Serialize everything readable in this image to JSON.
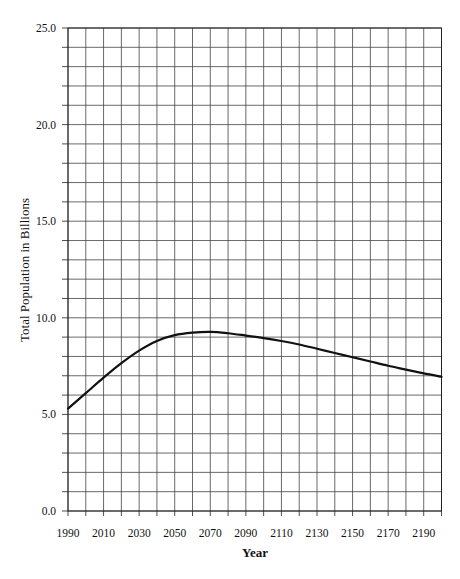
{
  "chart_data": {
    "type": "line",
    "title": "",
    "title_note": "Title cropped at top edge of image; text not legible",
    "xlabel": "Year",
    "ylabel": "Total Population in Billions",
    "xlim": [
      1990,
      2200
    ],
    "ylim": [
      0.0,
      25.0
    ],
    "x_ticks": [
      1990,
      2010,
      2030,
      2050,
      2070,
      2090,
      2110,
      2130,
      2150,
      2170,
      2190
    ],
    "x_tick_labels": [
      "1990",
      "2010",
      "2030",
      "2050",
      "2070",
      "2090",
      "2110",
      "2130",
      "2150",
      "2170",
      "2190"
    ],
    "x_minor_step": 10,
    "y_ticks": [
      0,
      5,
      10,
      15,
      20,
      25
    ],
    "y_tick_labels": [
      "0.0",
      "5.0",
      "10.0",
      "15.0",
      "20.0",
      "25.0"
    ],
    "y_minor_step": 1,
    "grid": true,
    "legend": null,
    "x": [
      1990,
      2000,
      2010,
      2020,
      2030,
      2040,
      2050,
      2060,
      2070,
      2080,
      2090,
      2100,
      2110,
      2120,
      2130,
      2140,
      2150,
      2160,
      2170,
      2180,
      2190,
      2200
    ],
    "series": [
      {
        "name": "Total Population",
        "color": "#111111",
        "values": [
          5.3,
          6.1,
          6.9,
          7.65,
          8.3,
          8.8,
          9.1,
          9.23,
          9.27,
          9.2,
          9.08,
          8.95,
          8.8,
          8.62,
          8.4,
          8.18,
          7.96,
          7.74,
          7.52,
          7.32,
          7.12,
          6.95
        ]
      }
    ]
  },
  "colors": {
    "grid": "#444444",
    "axis": "#222222",
    "line": "#111111",
    "background": "#ffffff"
  }
}
